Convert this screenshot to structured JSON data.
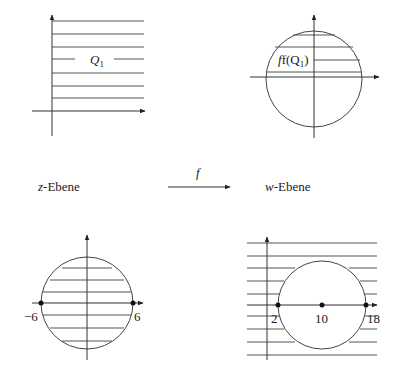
{
  "labels": {
    "z_plane": "z",
    "z_plane_suffix": "-Ebene",
    "w_plane": "w",
    "w_plane_suffix": "-Ebene",
    "map": "f"
  },
  "panels": {
    "top_left": {
      "description": "Quadrant Q1 in the z-plane, hatched",
      "region_label": "Q",
      "region_sub": "1"
    },
    "top_right": {
      "description": "Image f(Q1): upper half of unit disk, hatched",
      "region_label": "f(Q",
      "region_sub": "1",
      "region_close": ")"
    },
    "bottom_left": {
      "description": "Disk centered at 0 with radius 6",
      "tick_left": "−6",
      "tick_right": "6"
    },
    "bottom_right": {
      "description": "Exterior of disk centered at 10 with radius 8",
      "tick_left": "2",
      "tick_center": "10",
      "tick_right": "18"
    }
  },
  "colors": {
    "line": "#333333",
    "hatch": "#555555",
    "background": "#ffffff"
  }
}
